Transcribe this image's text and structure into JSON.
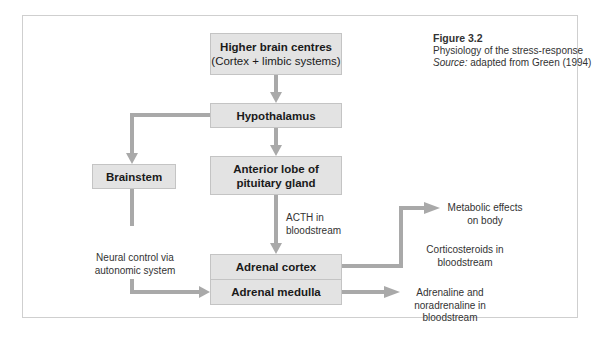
{
  "caption": {
    "figure": "Figure 3.2",
    "title": "Physiology of the stress-response",
    "source_label": "Source:",
    "source_text": " adapted from Green (1994)"
  },
  "boxes": {
    "higher_brain": {
      "line1": "Higher brain centres",
      "line2": "(Cortex + limbic systems)"
    },
    "hypothalamus": {
      "label": "Hypothalamus"
    },
    "anterior_lobe": {
      "line1": "Anterior lobe of",
      "line2": "pituitary gland"
    },
    "brainstem": {
      "label": "Brainstem"
    },
    "adrenal_cortex": {
      "label": "Adrenal cortex"
    },
    "adrenal_medulla": {
      "label": "Adrenal medulla"
    }
  },
  "labels": {
    "acth": {
      "line1": "ACTH in",
      "line2": "bloodstream"
    },
    "neural": {
      "line1": "Neural control via",
      "line2": "autonomic system"
    },
    "metabolic": {
      "line1": "Metabolic effects",
      "line2": "on body"
    },
    "corticosteroids": {
      "line1": "Corticosteroids in",
      "line2": "bloodstream"
    },
    "adrenaline": {
      "line1": "Adrenaline and",
      "line2": "noradrenaline in",
      "line3": "bloodstream"
    }
  },
  "colors": {
    "box_fill": "#e3e3e3",
    "box_border": "#c4c4c4",
    "arrow": "#a9a9a9",
    "frame": "#cfcfcf"
  }
}
